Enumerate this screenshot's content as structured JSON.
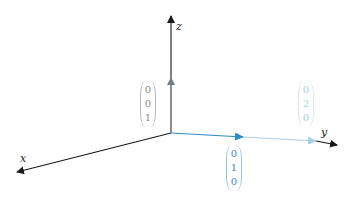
{
  "diagram": {
    "type": "3d-coordinate-axes-with-vectors",
    "origin": [
      171,
      133
    ],
    "axes": [
      {
        "name": "x",
        "label": "x",
        "from": [
          171,
          133
        ],
        "to": [
          17,
          172
        ],
        "color": "#1a1a1a"
      },
      {
        "name": "y",
        "label": "y",
        "from": [
          171,
          133
        ],
        "to": [
          337,
          145
        ],
        "color": "#1a1a1a"
      },
      {
        "name": "z",
        "label": "z",
        "from": [
          171,
          133
        ],
        "to": [
          171,
          16
        ],
        "color": "#1a1a1a"
      }
    ],
    "vectors": [
      {
        "name": "e_z",
        "components": [
          "0",
          "0",
          "1"
        ],
        "tip": [
          171,
          78
        ],
        "color": "#6f7f86",
        "label_color": "#8c8c8c"
      },
      {
        "name": "e_y",
        "components": [
          "0",
          "1",
          "0"
        ],
        "tip": [
          243,
          137
        ],
        "color": "#2f8bc4",
        "label_color": "#3a8dbf"
      },
      {
        "name": "2e_y",
        "components": [
          "0",
          "2",
          "0"
        ],
        "tip": [
          316,
          141
        ],
        "color": "#9fcbe3",
        "label_color": "#a9cde2"
      }
    ]
  },
  "labels": {
    "x": "x",
    "y": "y",
    "z": "z"
  }
}
